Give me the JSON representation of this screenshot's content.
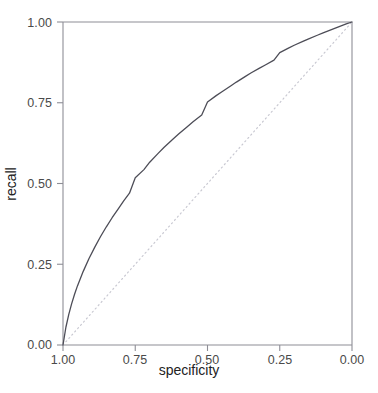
{
  "chart_data": {
    "type": "line",
    "title": "",
    "xlabel": "specificity",
    "ylabel": "recall",
    "xlim": [
      1.0,
      0.0
    ],
    "ylim": [
      0.0,
      1.0
    ],
    "x_reversed": true,
    "grid": false,
    "legend": "none",
    "xticks": [
      {
        "value": 1.0,
        "label": "1.00"
      },
      {
        "value": 0.75,
        "label": "0.75"
      },
      {
        "value": 0.5,
        "label": "0.50"
      },
      {
        "value": 0.25,
        "label": "0.25"
      },
      {
        "value": 0.0,
        "label": "0.00"
      }
    ],
    "yticks": [
      {
        "value": 0.0,
        "label": "0.00"
      },
      {
        "value": 0.25,
        "label": "0.25"
      },
      {
        "value": 0.5,
        "label": "0.50"
      },
      {
        "value": 0.75,
        "label": "0.75"
      },
      {
        "value": 1.0,
        "label": "1.00"
      }
    ],
    "series": [
      {
        "name": "roc-curve",
        "style": "solid",
        "color": "#4d4d57",
        "width": 1.3,
        "points": [
          [
            1.0,
            0.0
          ],
          [
            0.99,
            0.055
          ],
          [
            0.98,
            0.095
          ],
          [
            0.97,
            0.128
          ],
          [
            0.96,
            0.157
          ],
          [
            0.95,
            0.183
          ],
          [
            0.93,
            0.228
          ],
          [
            0.91,
            0.268
          ],
          [
            0.89,
            0.303
          ],
          [
            0.87,
            0.336
          ],
          [
            0.85,
            0.366
          ],
          [
            0.83,
            0.394
          ],
          [
            0.81,
            0.42
          ],
          [
            0.79,
            0.446
          ],
          [
            0.77,
            0.47
          ],
          [
            0.75,
            0.518
          ],
          [
            0.72,
            0.543
          ],
          [
            0.7,
            0.566
          ],
          [
            0.67,
            0.594
          ],
          [
            0.65,
            0.612
          ],
          [
            0.62,
            0.637
          ],
          [
            0.6,
            0.653
          ],
          [
            0.57,
            0.676
          ],
          [
            0.55,
            0.691
          ],
          [
            0.52,
            0.712
          ],
          [
            0.5,
            0.752
          ],
          [
            0.47,
            0.772
          ],
          [
            0.45,
            0.784
          ],
          [
            0.42,
            0.802
          ],
          [
            0.4,
            0.814
          ],
          [
            0.37,
            0.831
          ],
          [
            0.35,
            0.842
          ],
          [
            0.32,
            0.857
          ],
          [
            0.3,
            0.867
          ],
          [
            0.27,
            0.882
          ],
          [
            0.25,
            0.905
          ],
          [
            0.22,
            0.919
          ],
          [
            0.2,
            0.928
          ],
          [
            0.17,
            0.94
          ],
          [
            0.15,
            0.948
          ],
          [
            0.12,
            0.959
          ],
          [
            0.1,
            0.966
          ],
          [
            0.08,
            0.973
          ],
          [
            0.06,
            0.98
          ],
          [
            0.04,
            0.987
          ],
          [
            0.02,
            0.994
          ],
          [
            0.0,
            1.0
          ]
        ]
      },
      {
        "name": "chance-diagonal",
        "style": "dotted",
        "color": "#c9c9d2",
        "width": 1.2,
        "points": [
          [
            1.0,
            0.0
          ],
          [
            0.0,
            1.0
          ]
        ]
      }
    ]
  },
  "axes": {
    "x_title": "specificity",
    "y_title": "recall"
  }
}
